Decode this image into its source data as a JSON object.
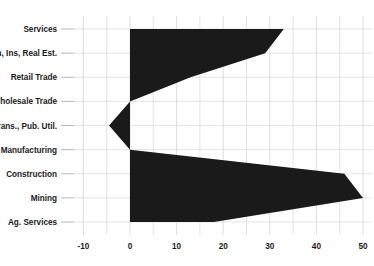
{
  "chart_data": {
    "type": "bar",
    "orientation": "horizontal",
    "title": "",
    "subtitle": "",
    "xlabel": "",
    "ylabel": "",
    "categories": [
      "Services",
      "Fin, Ins, Real Est.",
      "Retail Trade",
      "Wholesale Trade",
      "Trans., Pub. Util.",
      "Manufacturing",
      "Construction",
      "Mining",
      "Ag. Services"
    ],
    "values": [
      33,
      29,
      13,
      0,
      -4.5,
      0,
      46,
      50,
      18
    ],
    "xlim": [
      -12,
      52
    ],
    "ylim": [
      0,
      9
    ],
    "xticks": [
      -10,
      0,
      10,
      20,
      30,
      40,
      50
    ],
    "xtick_labels": [
      "-10",
      "0",
      "10",
      "20",
      "30",
      "40",
      "50"
    ],
    "minor_xticks": [
      -5,
      5,
      15,
      25,
      35,
      45
    ],
    "grid": true,
    "grid_axis": "both",
    "legend": false,
    "legend_position": "none",
    "series_color": "#1a1a1a",
    "baseline": 0,
    "annotations": []
  },
  "axis": {
    "zero_line_label": "0",
    "left_label": "-10",
    "right_label": "50"
  },
  "colors": {
    "fill": "#1a1a1a",
    "grid": "#d8d8d8",
    "tick": "#9a9a9a",
    "text": "#1a1a1a",
    "background": "#ffffff"
  }
}
